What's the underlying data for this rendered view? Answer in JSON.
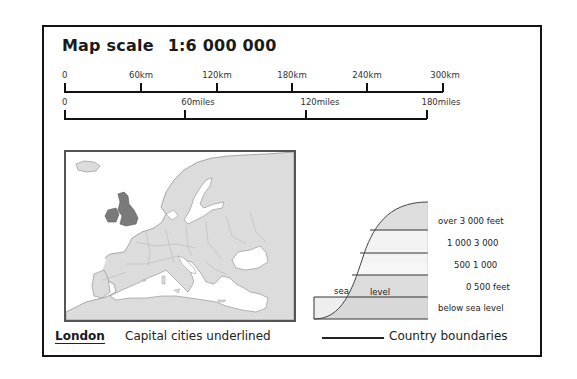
{
  "title": {
    "label": "Map scale",
    "ratio": "1:6 000 000"
  },
  "km_scale": {
    "ticks": [
      {
        "label": "0",
        "x": 64
      },
      {
        "label": "60km",
        "x": 140
      },
      {
        "label": "120km",
        "x": 216
      },
      {
        "label": "180km",
        "x": 291
      },
      {
        "label": "240km",
        "x": 366
      },
      {
        "label": "300km",
        "x": 442
      }
    ]
  },
  "miles_scale": {
    "ticks": [
      {
        "label": "0",
        "x": 64
      },
      {
        "label": "60miles",
        "x": 184
      },
      {
        "label": "120miles",
        "x": 305
      },
      {
        "label": "180miles",
        "x": 426
      }
    ]
  },
  "map": {
    "region": "Europe",
    "highlighted": "British Isles",
    "colors": {
      "land": "#dcdcdc",
      "highlight": "#7a7a7a",
      "sea": "#ffffff",
      "border": "#9a9a9a"
    }
  },
  "relief_legend": {
    "sea_label": "sea",
    "level_label": "level",
    "bands": [
      {
        "label": "over 3 000  feet",
        "fill": "#dedede"
      },
      {
        "label": "1 000 3 000",
        "fill": "#f3f3f3"
      },
      {
        "label": "500 1 000",
        "fill": "#f7f7f7"
      },
      {
        "label": "0   500 feet",
        "fill": "#dcdcdc"
      },
      {
        "label": "below sea level",
        "fill": "#e6e6e6"
      }
    ]
  },
  "footer": {
    "capital_example": "London",
    "capital_text": "Capital cities underlined",
    "boundaries_text": "Country boundaries"
  }
}
